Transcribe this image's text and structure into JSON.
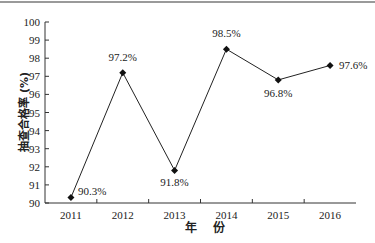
{
  "chart_data": {
    "type": "line",
    "title": "",
    "xlabel": "年 份",
    "ylabel": "抽查合格率 (%)",
    "categories": [
      "2011",
      "2012",
      "2013",
      "2014",
      "2015",
      "2016"
    ],
    "series": [
      {
        "name": "抽查合格率",
        "values": [
          90.3,
          97.2,
          91.8,
          98.5,
          96.8,
          97.6
        ],
        "labels": [
          "90.3%",
          "97.2%",
          "91.8%",
          "98.5%",
          "96.8%",
          "97.6%"
        ]
      }
    ],
    "ylim": [
      90,
      100
    ],
    "yticks": [
      "90",
      "91",
      "92",
      "93",
      "94",
      "95",
      "96",
      "97",
      "98",
      "99",
      "100"
    ],
    "grid": false,
    "legend": "none",
    "marker": "diamond",
    "line_color": "#222222"
  }
}
